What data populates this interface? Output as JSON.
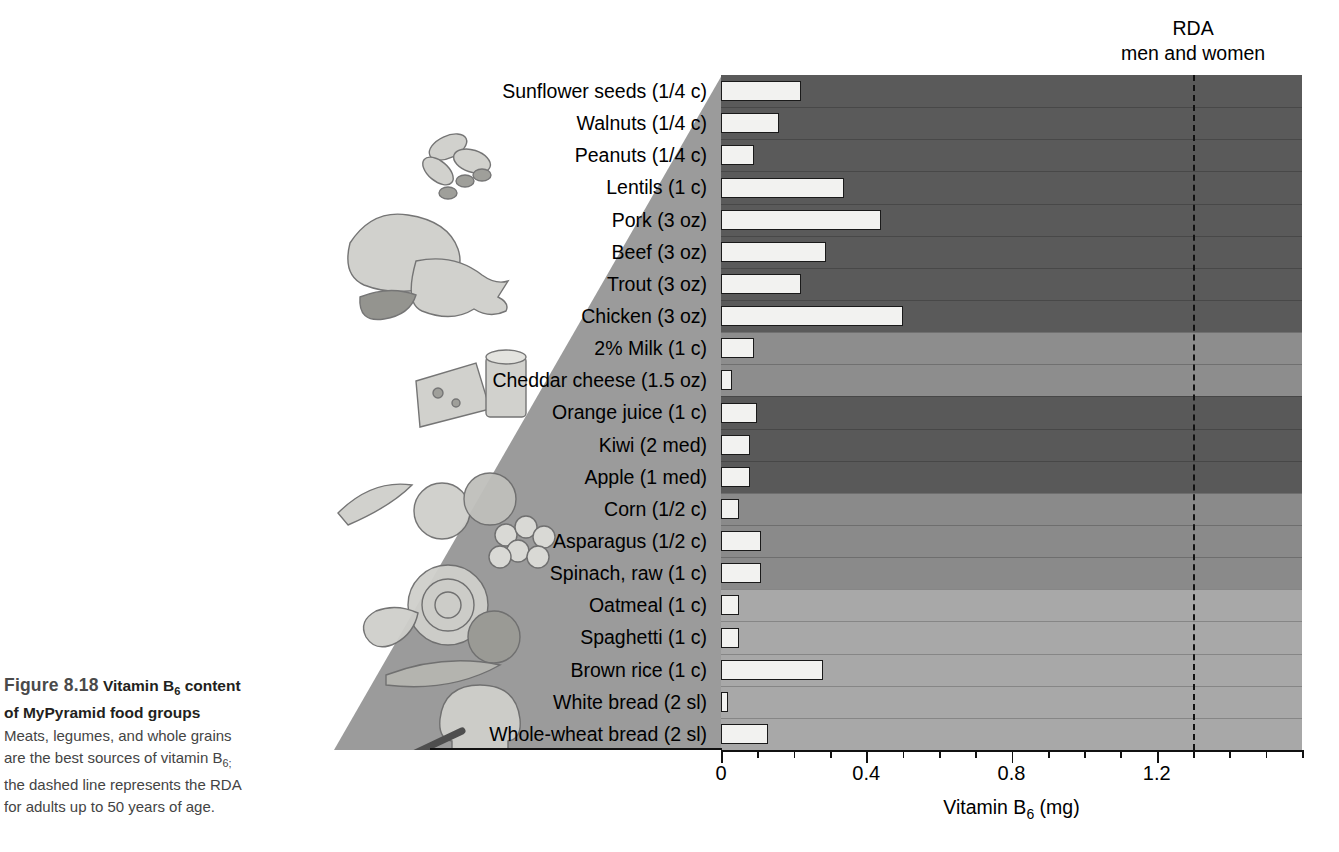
{
  "caption": {
    "figure_number": "Figure 8.18",
    "title_part1": "Vitamin B",
    "title_sub": "6",
    "title_part2": " content",
    "title_line2": "of MyPyramid food groups",
    "body_line1": "Meats, legumes, and whole grains",
    "body_line2_pre": "are the best sources of vitamin B",
    "body_line2_sub": "6;",
    "body_line3": "the dashed line represents the RDA",
    "body_line4": "for adults up to 50 years of age."
  },
  "annotations": {
    "rda_line1": "RDA",
    "rda_line2": "men and women",
    "rda_value": 1.3
  },
  "axis": {
    "title_pre": "Vitamin B",
    "title_sub": "6",
    "title_post": " (mg)",
    "tick_labels": [
      "0",
      "0.4",
      "0.8",
      "1.2"
    ],
    "tick_values": [
      0,
      0.4,
      0.8,
      1.2
    ],
    "minor_step": 0.1,
    "min": 0,
    "max": 1.6
  },
  "chart_data": {
    "type": "bar",
    "orientation": "horizontal",
    "title": "Vitamin B6 content of MyPyramid food groups",
    "xlabel": "Vitamin B6 (mg)",
    "ylabel": "",
    "xlim": [
      0,
      1.6
    ],
    "grid": false,
    "legend": "none",
    "reference_line": {
      "label": "RDA men and women",
      "value": 1.3,
      "style": "dashed"
    },
    "categories": [
      "Sunflower seeds (1/4 c)",
      "Walnuts (1/4 c)",
      "Peanuts (1/4 c)",
      "Lentils (1 c)",
      "Pork (3 oz)",
      "Beef (3 oz)",
      "Trout (3 oz)",
      "Chicken (3 oz)",
      "2% Milk (1 c)",
      "Cheddar cheese (1.5 oz)",
      "Orange juice (1 c)",
      "Kiwi (2 med)",
      "Apple (1 med)",
      "Corn (1/2 c)",
      "Asparagus (1/2 c)",
      "Spinach, raw (1 c)",
      "Oatmeal (1 c)",
      "Spaghetti (1 c)",
      "Brown rice (1 c)",
      "White bread (2 sl)",
      "Whole-wheat bread (2 sl)"
    ],
    "values": [
      0.22,
      0.16,
      0.09,
      0.34,
      0.44,
      0.29,
      0.22,
      0.5,
      0.09,
      0.03,
      0.1,
      0.08,
      0.08,
      0.05,
      0.11,
      0.11,
      0.05,
      0.05,
      0.28,
      0.02,
      0.13
    ],
    "groups": [
      {
        "name": "Meat, beans and nuts",
        "start": 0,
        "count": 8,
        "shade": "#5a5a5a"
      },
      {
        "name": "Milk",
        "start": 8,
        "count": 2,
        "shade": "#8d8d8d"
      },
      {
        "name": "Fruits",
        "start": 10,
        "count": 3,
        "shade": "#595959"
      },
      {
        "name": "Vegetables",
        "start": 13,
        "count": 3,
        "shade": "#8a8a8a"
      },
      {
        "name": "Grains",
        "start": 16,
        "count": 5,
        "shade": "#a8a8a8"
      }
    ]
  },
  "colors": {
    "bar_fill": "#f2f2f0",
    "bar_stroke": "#1a1a1a",
    "pyramid_fill": "#9b9b9b",
    "axis": "#111111"
  }
}
